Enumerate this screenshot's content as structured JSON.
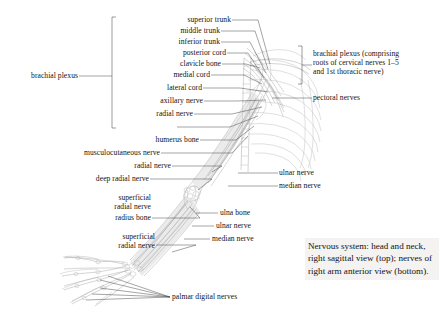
{
  "figure": {
    "caption": "Nervous system: head and neck, right sagittal view (top); nerves of right arm anterior view (bottom).",
    "palette": {
      "background": "#ffffff",
      "text": "#15120f",
      "leader_line": "#4a4a4a",
      "artwork_light": "#b9b9b9",
      "artwork_mid": "#a2a2a2",
      "artwork_dark": "#8d8d8d",
      "caption_background": "#f4f3f1"
    }
  },
  "labels_left": [
    {
      "id": "brachial-plexus",
      "text": "brachial plexus",
      "lines": [
        "brachial plexus"
      ]
    },
    {
      "id": "humerus-bone",
      "text": "humerus bone",
      "lines": [
        "humerus bone"
      ]
    },
    {
      "id": "musculocutaneous-nerve",
      "text": "musculocutaneous nerve",
      "lines": [
        "musculocutaneous nerve"
      ]
    },
    {
      "id": "radial-nerve-upper",
      "text": "radial nerve",
      "lines": [
        "radial nerve"
      ]
    },
    {
      "id": "deep-radial-nerve",
      "text": "deep radial nerve",
      "lines": [
        "deep radial nerve"
      ]
    },
    {
      "id": "superficial-radial-nerve-1",
      "text": "superficial radial nerve",
      "lines": [
        "superficial",
        "radial nerve"
      ]
    },
    {
      "id": "radius-bone",
      "text": "radius bone",
      "lines": [
        "radius bone"
      ]
    },
    {
      "id": "superficial-radial-nerve-2",
      "text": "superficial radial nerve",
      "lines": [
        "superficial",
        "radial nerve"
      ]
    }
  ],
  "labels_center": [
    {
      "id": "superior-trunk",
      "text": "superior trunk"
    },
    {
      "id": "middle-trunk",
      "text": "middle trunk"
    },
    {
      "id": "inferior-trunk",
      "text": "inferior trunk"
    },
    {
      "id": "posterior-cord",
      "text": "posterior cord"
    },
    {
      "id": "clavicle-bone",
      "text": "clavicle bone"
    },
    {
      "id": "medial-cord",
      "text": "medial cord"
    },
    {
      "id": "lateral-cord",
      "text": "lateral cord"
    },
    {
      "id": "axillary-nerve",
      "text": "axillary nerve"
    },
    {
      "id": "radial-nerve",
      "text": "radial nerve"
    },
    {
      "id": "ulna-bone",
      "text": "ulna bone"
    },
    {
      "id": "ulnar-nerve-lower",
      "text": "ulnar nerve"
    },
    {
      "id": "median-nerve-lower",
      "text": "median nerve"
    },
    {
      "id": "palmar-digital-nerves",
      "text": "palmar digital nerves"
    }
  ],
  "labels_right": [
    {
      "id": "brachial-plexus-detail",
      "lines": [
        "brachial plexus (comprising",
        "roots of cervical nerves 1–5",
        "and 1st thoracic nerve)"
      ]
    },
    {
      "id": "pectoral-nerves",
      "text": "pectoral nerves"
    },
    {
      "id": "ulnar-nerve",
      "text": "ulnar nerve"
    },
    {
      "id": "median-nerve",
      "text": "median nerve"
    }
  ]
}
